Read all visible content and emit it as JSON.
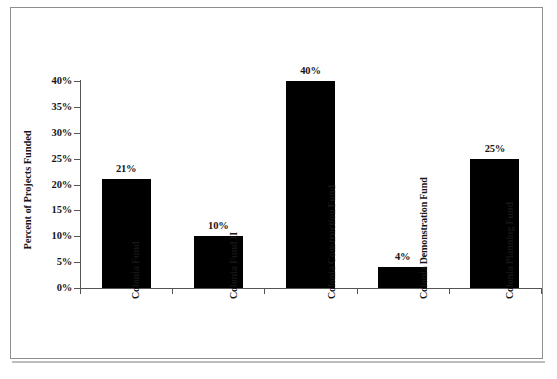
{
  "chart_data": {
    "type": "bar",
    "title": "",
    "xlabel": "",
    "ylabel": "Percent of Projects Funded",
    "categories": [
      "Colonia Fund",
      "Colonia Fund II",
      "Colonia Construction Fund",
      "Colonia Demonstration Fund",
      "Colonia Planning Fund"
    ],
    "category_lines": [
      [
        "Colonia Fund"
      ],
      [
        "Colonia Fund",
        "II"
      ],
      [
        "Colonia",
        "Construction",
        "Fund"
      ],
      [
        "Colonia",
        "Demonstration",
        "Fund"
      ],
      [
        "Colonia",
        "Planning Fund"
      ]
    ],
    "values": [
      21,
      10,
      40,
      4,
      25
    ],
    "value_labels": [
      "21%",
      "10%",
      "40%",
      "4%",
      "25%"
    ],
    "ylim": [
      0,
      40
    ],
    "ytick_values": [
      0,
      5,
      10,
      15,
      20,
      25,
      30,
      35,
      40
    ],
    "ytick_labels": [
      "0%",
      "5%",
      "10%",
      "15%",
      "20%",
      "25%",
      "30%",
      "35%",
      "40%"
    ],
    "grid": false,
    "legend": false,
    "bar_color": "#000000",
    "axis_color": "#555555",
    "text_color": "#161616",
    "background_color": "#ffffff"
  }
}
